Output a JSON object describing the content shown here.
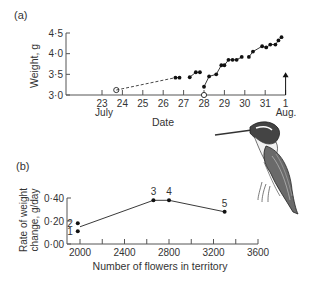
{
  "chart_data": [
    {
      "panel": "(a)",
      "type": "scatter",
      "title": "",
      "xlabel": "Date",
      "ylabel": "Weight, g",
      "ylim": [
        3.0,
        4.5
      ],
      "yticks": [
        "3·0",
        "3·5",
        "4·0",
        "4·5"
      ],
      "xticks": [
        "23",
        "24",
        "25",
        "26",
        "27",
        "28",
        "29",
        "30",
        "31",
        "1"
      ],
      "xtick_sublabels": {
        "23": "July",
        "1": "Aug."
      },
      "series": [
        {
          "name": "open-points",
          "marker": "open-circle",
          "x": [
            23.7,
            28.0
          ],
          "y": [
            3.12,
            3.0
          ]
        },
        {
          "name": "dashed-link",
          "style": "dashed",
          "x": [
            23.7,
            26.6
          ],
          "y": [
            3.12,
            3.42
          ]
        },
        {
          "name": "segment-1",
          "marker": "filled-circle",
          "x": [
            26.6,
            26.8
          ],
          "y": [
            3.42,
            3.42
          ]
        },
        {
          "name": "segment-2",
          "marker": "filled-circle",
          "x": [
            27.3,
            27.6,
            27.8
          ],
          "y": [
            3.43,
            3.55,
            3.55
          ]
        },
        {
          "name": "segment-3",
          "marker": "filled-circle",
          "x": [
            28.0,
            28.25,
            28.6,
            28.85,
            29.0,
            29.2,
            29.4,
            29.6,
            29.85
          ],
          "y": [
            3.2,
            3.45,
            3.5,
            3.72,
            3.72,
            3.85,
            3.85,
            3.85,
            3.92
          ]
        },
        {
          "name": "segment-4",
          "marker": "filled-circle",
          "x": [
            30.2,
            30.4,
            30.85,
            31.05,
            31.25,
            31.5,
            31.65,
            31.8
          ],
          "y": [
            3.92,
            4.05,
            4.18,
            4.15,
            4.22,
            4.22,
            4.32,
            4.4
          ]
        }
      ],
      "annotations": [
        {
          "type": "arrow-up",
          "x": 32.0,
          "y_from": 3.0,
          "y_to": 3.55
        }
      ]
    },
    {
      "panel": "(b)",
      "type": "line",
      "title": "",
      "xlabel": "Number of flowers in territory",
      "ylabel": "Rate of weight change, g/day",
      "ylim": [
        0.0,
        0.4
      ],
      "xlim": [
        1900,
        3600
      ],
      "yticks": [
        "0·00",
        "0·20",
        "0·40"
      ],
      "xticks": [
        "2000",
        "2400",
        "2800",
        "3200",
        "3600"
      ],
      "points": [
        {
          "label": "1",
          "x": 1980,
          "y": 0.11
        },
        {
          "label": "2",
          "x": 1980,
          "y": 0.18
        },
        {
          "label": "3",
          "x": 2660,
          "y": 0.38
        },
        {
          "label": "4",
          "x": 2800,
          "y": 0.38
        },
        {
          "label": "5",
          "x": 3300,
          "y": 0.28
        }
      ],
      "trend_line": {
        "x": [
          2000,
          2660,
          2800,
          3300
        ],
        "y": [
          0.15,
          0.38,
          0.38,
          0.28
        ]
      }
    }
  ],
  "labels": {
    "panel_a": "(a)",
    "panel_b": "(b)",
    "ylabel_a": "Weight, g",
    "xlabel_a": "Date",
    "july": "July",
    "aug": "Aug.",
    "ylabel_b_line1": "Rate of weight",
    "ylabel_b_line2": "change, g/day",
    "xlabel_b": "Number of flowers in territory"
  },
  "illustration": {
    "subject": "hummingbird-drawing"
  }
}
